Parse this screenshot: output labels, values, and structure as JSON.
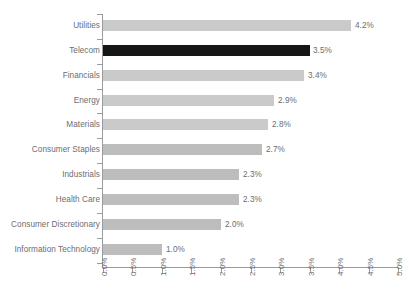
{
  "chart_data": {
    "type": "bar",
    "orientation": "horizontal",
    "title": "",
    "subtitle": "",
    "xlabel": "",
    "ylabel": "",
    "xlim": [
      0.0,
      5.0
    ],
    "xtick_labels": [
      "0.0%",
      "0.5%",
      "1.0%",
      "1.5%",
      "2.0%",
      "2.5%",
      "3.0%",
      "3.5%",
      "4.0%",
      "4.5%",
      "5.0%"
    ],
    "xtick_values": [
      0.0,
      0.5,
      1.0,
      1.5,
      2.0,
      2.5,
      3.0,
      3.5,
      4.0,
      4.5,
      5.0
    ],
    "grid": false,
    "legend": "none",
    "categories": [
      "Utilities",
      "Telecom",
      "Financials",
      "Energy",
      "Materials",
      "Consumer Staples",
      "Industrials",
      "Health Care",
      "Consumer Discretionary",
      "Information Technology"
    ],
    "values": [
      4.2,
      3.5,
      3.4,
      2.9,
      2.8,
      2.7,
      2.3,
      2.3,
      2.0,
      1.0
    ],
    "data_labels": [
      "4.2%",
      "3.5%",
      "3.4%",
      "2.9%",
      "2.8%",
      "2.7%",
      "2.3%",
      "2.3%",
      "2.0%",
      "1.0%"
    ],
    "highlighted_category": "Telecom",
    "colors": {
      "bar": "#c4c4c4",
      "bar_light": "#cacaca",
      "bar_dark": "#bdbdbd",
      "highlight": "#161616",
      "axis": "#9a9b9e",
      "text": "#6c6d70",
      "background": "#ffffff"
    }
  }
}
